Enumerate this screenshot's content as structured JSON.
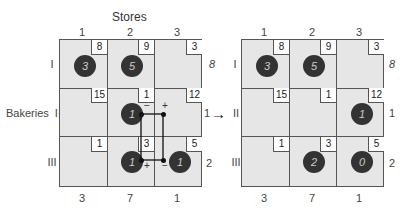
{
  "title": "Stores",
  "row_title": "Bakeries",
  "left": {
    "col_labels": [
      "1",
      "2",
      "3"
    ],
    "row_labels": [
      "I",
      "II",
      "III"
    ],
    "supply": [
      "8",
      "1",
      "2"
    ],
    "demand": [
      "3",
      "7",
      "1"
    ],
    "costs": [
      [
        "8",
        "9",
        "3"
      ],
      [
        "15",
        "1",
        "12"
      ],
      [
        "1",
        "3",
        "5"
      ]
    ],
    "allocations": {
      "r0c0": "3",
      "r0c1": "5",
      "r1c1": "1",
      "r2c1": "1",
      "r2c2": "1"
    },
    "loop_signs": {
      "r1c1": "−",
      "r1c2": "+",
      "r2c1": "+",
      "r2c2": "−"
    }
  },
  "right": {
    "col_labels": [
      "1",
      "2",
      "3"
    ],
    "row_labels": [
      "I",
      "II",
      "III"
    ],
    "supply": [
      "8",
      "1",
      "2"
    ],
    "demand": [
      "3",
      "7",
      "1"
    ],
    "costs": [
      [
        "8",
        "9",
        "3"
      ],
      [
        "15",
        "1",
        "12"
      ],
      [
        "1",
        "3",
        "5"
      ]
    ],
    "allocations": {
      "r0c0": "3",
      "r0c1": "5",
      "r1c2": "1",
      "r2c1": "2",
      "r2c2": "0"
    }
  },
  "arrow": "→",
  "colors": {
    "cell_bg": "#e6e6e6",
    "circle": "#333333",
    "border": "#555555"
  }
}
